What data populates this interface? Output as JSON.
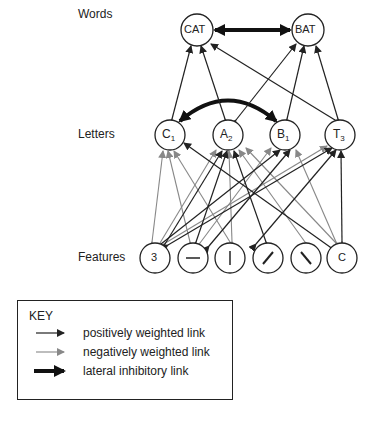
{
  "levels": {
    "words": "Words",
    "letters": "Letters",
    "features": "Features"
  },
  "word_nodes": [
    {
      "label": "CAT",
      "x": 197,
      "y": 30
    },
    {
      "label": "BAT",
      "x": 308,
      "y": 30
    }
  ],
  "letter_nodes": [
    {
      "label": "C",
      "sub": "1",
      "x": 170,
      "y": 135
    },
    {
      "label": "A",
      "sub": "2",
      "x": 228,
      "y": 135
    },
    {
      "label": "B",
      "sub": "1",
      "x": 285,
      "y": 135
    },
    {
      "label": "T",
      "sub": "3",
      "x": 340,
      "y": 135
    }
  ],
  "feature_nodes": [
    {
      "label": "3",
      "x": 155,
      "y": 258
    },
    {
      "label": "—",
      "x": 193,
      "y": 258
    },
    {
      "label": "|",
      "x": 230,
      "y": 258
    },
    {
      "label": "/",
      "x": 268,
      "y": 258
    },
    {
      "label": "\\",
      "x": 306,
      "y": 258
    },
    {
      "label": "C",
      "x": 342,
      "y": 258
    }
  ],
  "key": {
    "title": "KEY",
    "items": [
      {
        "label": "positively weighted link",
        "type": "positive",
        "color": "#222222"
      },
      {
        "label": "negatively weighted link",
        "type": "negative",
        "color": "#888888"
      },
      {
        "label": "lateral inhibitory link",
        "type": "lateral",
        "color": "#111111"
      }
    ]
  }
}
